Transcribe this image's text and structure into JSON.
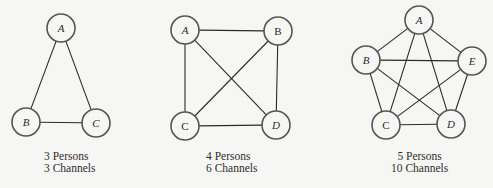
{
  "figure": {
    "style": {
      "background": "#f6f6f4",
      "line_color": "#2b2b2b",
      "node_fill": "#f6f6f4",
      "node_stroke": "#555555",
      "node_radius": 14
    },
    "diagrams": [
      {
        "id": "three-persons",
        "caption": {
          "persons": "3 Persons",
          "channels": "3 Channels"
        },
        "nodes": [
          {
            "label": "A",
            "x": 61,
            "y": 28,
            "italic": true
          },
          {
            "label": "B",
            "x": 26,
            "y": 122,
            "italic": true
          },
          {
            "label": "C",
            "x": 96,
            "y": 123,
            "italic": true
          }
        ],
        "edges": [
          [
            "A",
            "B"
          ],
          [
            "A",
            "C"
          ],
          [
            "B",
            "C"
          ]
        ]
      },
      {
        "id": "four-persons",
        "caption": {
          "persons": "4 Persons",
          "channels": "6 Channels"
        },
        "nodes": [
          {
            "label": "A",
            "x": 185,
            "y": 30,
            "italic": true
          },
          {
            "label": "B",
            "x": 278,
            "y": 31,
            "italic": false
          },
          {
            "label": "C",
            "x": 185,
            "y": 126,
            "italic": false
          },
          {
            "label": "D",
            "x": 276,
            "y": 125,
            "italic": true
          }
        ],
        "edges": [
          [
            "A",
            "B"
          ],
          [
            "A",
            "C"
          ],
          [
            "A",
            "D"
          ],
          [
            "B",
            "C"
          ],
          [
            "B",
            "D"
          ],
          [
            "C",
            "D"
          ]
        ]
      },
      {
        "id": "five-persons",
        "caption": {
          "persons": "5 Persons",
          "channels": "10 Channels"
        },
        "nodes": [
          {
            "label": "A",
            "x": 419,
            "y": 20,
            "italic": true
          },
          {
            "label": "B",
            "x": 366,
            "y": 60,
            "italic": true
          },
          {
            "label": "E",
            "x": 472,
            "y": 61,
            "italic": true
          },
          {
            "label": "C",
            "x": 386,
            "y": 125,
            "italic": false
          },
          {
            "label": "D",
            "x": 451,
            "y": 124,
            "italic": true
          }
        ],
        "edges": [
          [
            "A",
            "B"
          ],
          [
            "A",
            "C"
          ],
          [
            "A",
            "D"
          ],
          [
            "A",
            "E"
          ],
          [
            "B",
            "C"
          ],
          [
            "B",
            "D"
          ],
          [
            "B",
            "E"
          ],
          [
            "C",
            "D"
          ],
          [
            "C",
            "E"
          ],
          [
            "D",
            "E"
          ]
        ]
      }
    ]
  }
}
